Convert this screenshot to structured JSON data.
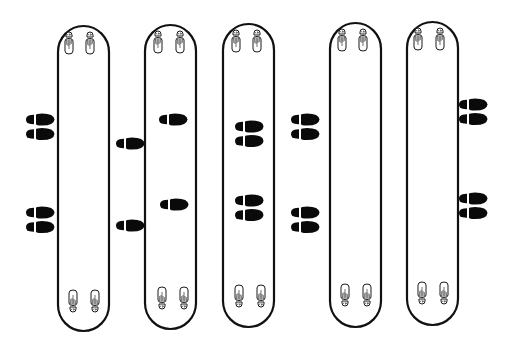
{
  "diagram": {
    "title": "Footprint position diagram",
    "stroke_color": "#111111",
    "fill_color": "#0a0a0a",
    "background": "#ffffff",
    "lanes": [
      {
        "id": "lane-1",
        "x": 57,
        "width": 52,
        "top": 26,
        "bottom": 331
      },
      {
        "id": "lane-2",
        "x": 145,
        "width": 51,
        "top": 25,
        "bottom": 329
      },
      {
        "id": "lane-3",
        "x": 223,
        "width": 51,
        "top": 24,
        "bottom": 327
      },
      {
        "id": "lane-4",
        "x": 330,
        "width": 51,
        "top": 23,
        "bottom": 327
      },
      {
        "id": "lane-5",
        "x": 407,
        "width": 51,
        "top": 22,
        "bottom": 325
      }
    ],
    "shoe_marks": [
      {
        "group": "left-of-lane-1",
        "x": 26,
        "y": 114,
        "type": "pair"
      },
      {
        "group": "left-of-lane-1",
        "x": 26,
        "y": 207,
        "type": "pair"
      },
      {
        "group": "between-lane-1-2",
        "x": 116,
        "y": 138,
        "type": "single"
      },
      {
        "group": "between-lane-1-2",
        "x": 116,
        "y": 220,
        "type": "single"
      },
      {
        "group": "inside-lane-2",
        "x": 159,
        "y": 114,
        "type": "single"
      },
      {
        "group": "inside-lane-2",
        "x": 160,
        "y": 199,
        "type": "single"
      },
      {
        "group": "inside-lane-3",
        "x": 235,
        "y": 121,
        "type": "pair"
      },
      {
        "group": "inside-lane-3",
        "x": 235,
        "y": 195,
        "type": "pair"
      },
      {
        "group": "between-lane-3-4",
        "x": 291,
        "y": 114,
        "type": "pair"
      },
      {
        "group": "between-lane-3-4",
        "x": 291,
        "y": 207,
        "type": "pair"
      },
      {
        "group": "right-of-lane-5",
        "x": 459,
        "y": 99,
        "type": "pair"
      },
      {
        "group": "right-of-lane-5",
        "x": 459,
        "y": 193,
        "type": "pair"
      }
    ]
  }
}
